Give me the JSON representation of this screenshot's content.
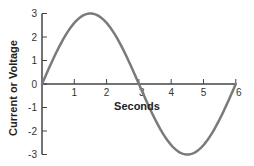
{
  "chart_data": {
    "type": "line",
    "title": "",
    "xlabel": "Seconds",
    "ylabel": "Current or Voltage",
    "xlim": [
      0,
      6
    ],
    "ylim": [
      -3,
      3
    ],
    "x_ticks": [
      1,
      2,
      3,
      4,
      5,
      6
    ],
    "y_ticks": [
      3,
      2,
      1,
      0,
      -1,
      -2,
      -3
    ],
    "grid": false,
    "legend": null,
    "series": [
      {
        "name": "sine wave",
        "function": "3*sin(pi*x/3)",
        "x": [
          0,
          0.5,
          1,
          1.5,
          2,
          2.5,
          3,
          3.5,
          4,
          4.5,
          5,
          5.5,
          6
        ],
        "values": [
          0,
          1.5,
          2.6,
          3,
          2.6,
          1.5,
          0,
          -1.5,
          -2.6,
          -3,
          -2.6,
          -1.5,
          0
        ]
      }
    ]
  },
  "colors": {
    "curve": "#7a7a7a",
    "axis": "#444444",
    "text": "#333333"
  },
  "layout": {
    "origin_x": 42,
    "origin_y": 84,
    "px_per_x": 32.3,
    "px_per_y": 23.5
  }
}
